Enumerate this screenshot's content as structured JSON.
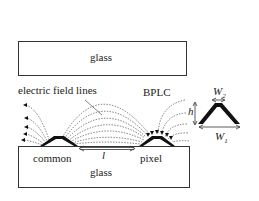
{
  "diagram": {
    "top_substrate": {
      "label": "glass"
    },
    "bottom_substrate": {
      "label": "glass"
    },
    "field_lines_label": "electric field lines",
    "medium_label": "BPLC",
    "common_electrode_label": "common",
    "pixel_electrode_label": "pixel",
    "gap_label": "l",
    "inset": {
      "top_width_label": "W",
      "top_width_sub": "2",
      "height_label": "h",
      "bottom_width_label": "W",
      "bottom_width_sub": "1"
    },
    "colors": {
      "line": "#222222",
      "electrode": "#111111",
      "field": "#555555",
      "box": "#333333"
    }
  }
}
